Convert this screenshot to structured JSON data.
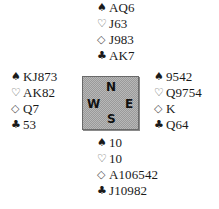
{
  "deal": {
    "north": {
      "spades": "AQ6",
      "hearts": "J63",
      "diamonds": "J983",
      "clubs": "AK7"
    },
    "west": {
      "spades": "KJ873",
      "hearts": "AK82",
      "diamonds": "Q7",
      "clubs": "53"
    },
    "east": {
      "spades": "9542",
      "hearts": "Q9754",
      "diamonds": "K",
      "clubs": "Q64"
    },
    "south": {
      "spades": "10",
      "hearts": "10",
      "diamonds": "A106542",
      "clubs": "J10982"
    }
  },
  "suit_symbols": {
    "spades": "♠",
    "hearts": "♡",
    "diamonds": "◇",
    "clubs": "♣"
  },
  "compass": {
    "n": "N",
    "s": "S",
    "w": "W",
    "e": "E"
  }
}
